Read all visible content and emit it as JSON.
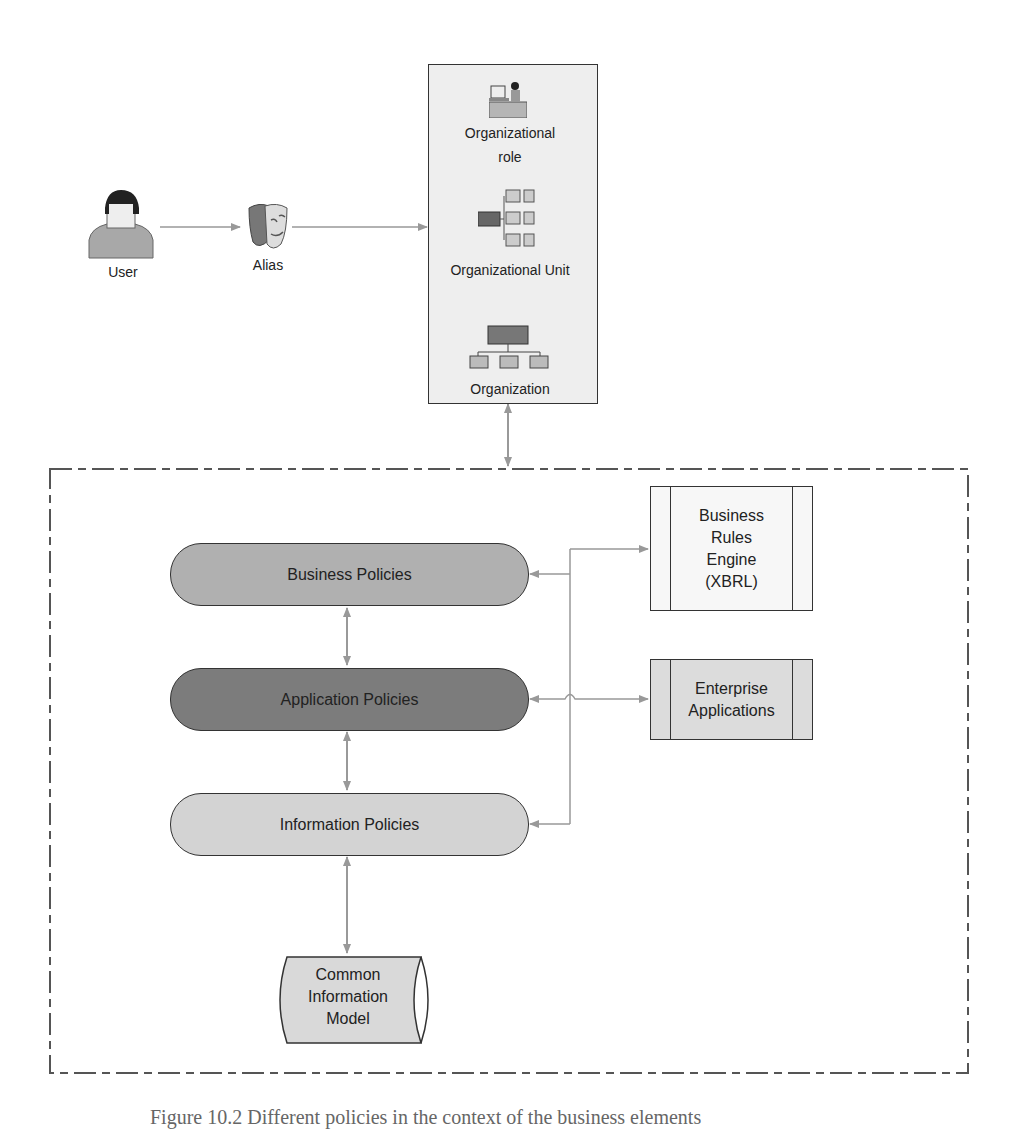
{
  "identity": {
    "user_label": "User",
    "alias_label": "Alias"
  },
  "organization_box": {
    "role_label_line1": "Organizational",
    "role_label_line2": "role",
    "unit_label": "Organizational Unit",
    "organization_label": "Organization"
  },
  "policies": {
    "business": {
      "label": "Business Policies",
      "color": "#b0b0b0"
    },
    "application": {
      "label": "Application Policies",
      "color": "#7c7c7c"
    },
    "information": {
      "label": "Information Policies",
      "color": "#d3d3d3"
    }
  },
  "external_systems": {
    "rules_engine": {
      "line1": "Business",
      "line2": "Rules",
      "line3": "Engine",
      "line4": "(XBRL)"
    },
    "enterprise_apps": {
      "line1": "Enterprise",
      "line2": "Applications"
    }
  },
  "data_store": {
    "line1": "Common",
    "line2": "Information",
    "line3": "Model"
  },
  "caption": "Figure 10.2   Different policies in the context of the business elements",
  "colors": {
    "connector": "#999999",
    "policy_area_bg": "#d9d9d9",
    "org_box_bg": "#eeeeee"
  }
}
